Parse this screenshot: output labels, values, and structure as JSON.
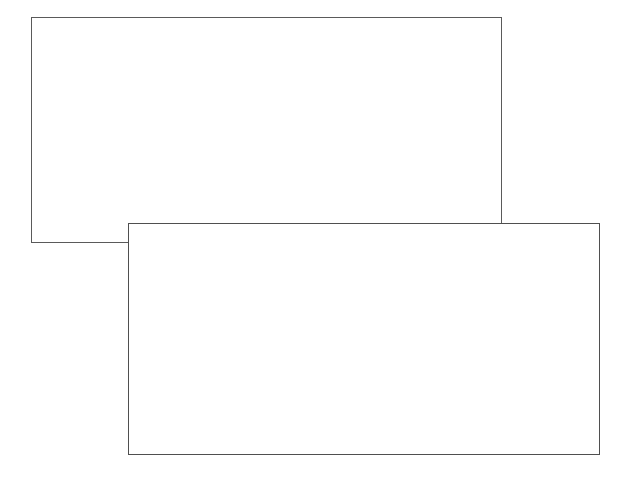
{
  "canvas": {
    "width": 627,
    "height": 486,
    "background_color": "#ffffff",
    "description": "Two overlapping blank rectangular panel outlines on a white background"
  },
  "panels": [
    {
      "name": "back-panel",
      "label": "",
      "content": "",
      "x": 31,
      "y": 17,
      "width": 471,
      "height": 226,
      "border_color": "#5a5a5a",
      "border_width": 1,
      "fill_color": "#ffffff",
      "stacking": 1
    },
    {
      "name": "front-panel",
      "label": "",
      "content": "",
      "x": 128,
      "y": 223,
      "width": 472,
      "height": 232,
      "border_color": "#4f4f4f",
      "border_width": 1,
      "fill_color": "#ffffff",
      "stacking": 2
    }
  ]
}
